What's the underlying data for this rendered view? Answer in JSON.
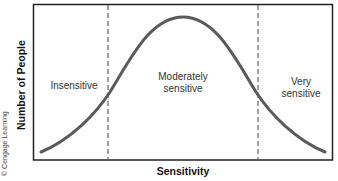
{
  "diagram": {
    "xlabel": "Sensitivity",
    "ylabel": "Number of People",
    "copyright": "© Cengage Learning",
    "regions": [
      {
        "label_line1": "Insensitive",
        "label_line2": ""
      },
      {
        "label_line1": "Moderately",
        "label_line2": "sensitive"
      },
      {
        "label_line1": "Very",
        "label_line2": "sensitive"
      }
    ],
    "curve": "bell-shaped normal distribution",
    "colors": {
      "curve": "#5a5a5a",
      "frame": "#222222",
      "divider": "#444444"
    }
  }
}
